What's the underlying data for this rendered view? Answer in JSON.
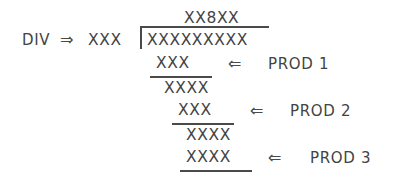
{
  "figure": {
    "type": "long-division-schematic",
    "background_color": "#ffffff",
    "ink_color": "#434343",
    "placeholder_symbol": "X"
  },
  "divisor_block": {
    "name_label": "DIV",
    "pointer_arrow": "⇒",
    "divisor_digits": "XXX"
  },
  "quotient": {
    "digits": "XX8XX",
    "highlighted_digit": "8",
    "highlighted_position": 3,
    "length": 5
  },
  "dividend": {
    "digits": "XXXXXXXXX",
    "length": 9
  },
  "bracket": {
    "vertical_rule": true,
    "overbar_rule": true
  },
  "steps": [
    {
      "step": 1,
      "product_digits": "XXX",
      "product_length": 3,
      "arrow": "⇐",
      "label": "PROD 1",
      "underlined": true,
      "remainder_digits": "XXXX",
      "remainder_length": 4
    },
    {
      "step": 2,
      "product_digits": "XXX",
      "product_length": 3,
      "arrow": "⇐",
      "label": "PROD 2",
      "underlined": true,
      "remainder_digits": "XXXX",
      "remainder_length": 4
    },
    {
      "step": 3,
      "product_digits": "XXXX",
      "product_length": 4,
      "arrow": "⇐",
      "label": "PROD 3",
      "underlined": true,
      "remainder_digits": null,
      "remainder_length": 0
    }
  ]
}
